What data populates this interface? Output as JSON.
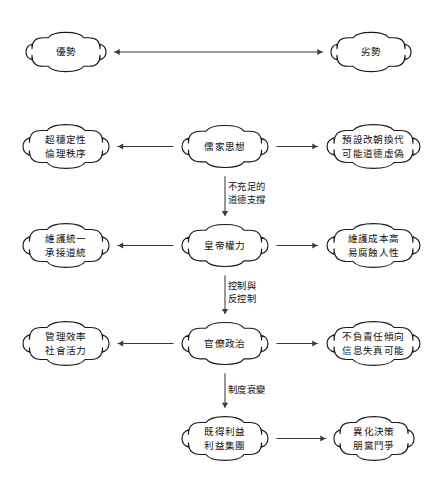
{
  "diagram": {
    "type": "flowchart",
    "background_color": "#ffffff",
    "node_fill": "#ffffff",
    "node_stroke": "#1a1a1a",
    "edge_color": "#3b3b3b",
    "nodes": [
      {
        "id": "advantage-header",
        "name": "advantage-header-node",
        "lines": [
          "優勢"
        ],
        "x": 25,
        "y": 31,
        "w": 82,
        "h": 42,
        "column": "left",
        "row": 0
      },
      {
        "id": "disadvantage-header",
        "name": "disadvantage-header-node",
        "lines": [
          "劣勢"
        ],
        "x": 330,
        "y": 31,
        "w": 82,
        "h": 42,
        "column": "right",
        "row": 0
      },
      {
        "id": "confucian-advantage",
        "name": "confucian-advantage-node",
        "lines": [
          "超穩定性",
          "倫理秩序"
        ],
        "x": 22,
        "y": 123,
        "w": 88,
        "h": 47,
        "column": "left",
        "row": 1
      },
      {
        "id": "confucian-thought",
        "name": "confucian-thought-node",
        "lines": [
          "儒家思想"
        ],
        "x": 181,
        "y": 124,
        "w": 88,
        "h": 45,
        "column": "center",
        "row": 1
      },
      {
        "id": "confucian-disadvantage",
        "name": "confucian-disadvantage-node",
        "lines": [
          "預設改朝換代",
          "可能道德虛偽"
        ],
        "x": 326,
        "y": 123,
        "w": 95,
        "h": 47,
        "column": "right",
        "row": 1
      },
      {
        "id": "emperor-advantage",
        "name": "emperor-advantage-node",
        "lines": [
          "維護統一",
          "承接道統"
        ],
        "x": 22,
        "y": 222,
        "w": 88,
        "h": 47,
        "column": "left",
        "row": 2
      },
      {
        "id": "emperor-power",
        "name": "emperor-power-node",
        "lines": [
          "皇帝權力"
        ],
        "x": 181,
        "y": 223,
        "w": 88,
        "h": 45,
        "column": "center",
        "row": 2
      },
      {
        "id": "emperor-disadvantage",
        "name": "emperor-disadvantage-node",
        "lines": [
          "維護成本高",
          "易腐蝕人性"
        ],
        "x": 326,
        "y": 222,
        "w": 95,
        "h": 47,
        "column": "right",
        "row": 2
      },
      {
        "id": "bureaucracy-advantage",
        "name": "bureaucracy-advantage-node",
        "lines": [
          "管理效率",
          "社會活力"
        ],
        "x": 22,
        "y": 320,
        "w": 88,
        "h": 47,
        "column": "left",
        "row": 3
      },
      {
        "id": "bureaucratic-politics",
        "name": "bureaucratic-politics-node",
        "lines": [
          "官僚政治"
        ],
        "x": 181,
        "y": 321,
        "w": 88,
        "h": 45,
        "column": "center",
        "row": 3
      },
      {
        "id": "bureaucracy-disadvantage",
        "name": "bureaucracy-disadvantage-node",
        "lines": [
          "不負責任傾向",
          "信息失真可能"
        ],
        "x": 326,
        "y": 320,
        "w": 95,
        "h": 47,
        "column": "right",
        "row": 3
      },
      {
        "id": "vested-interests",
        "name": "vested-interests-node",
        "lines": [
          "既得利益",
          "利益集團"
        ],
        "x": 181,
        "y": 415,
        "w": 88,
        "h": 47,
        "column": "center",
        "row": 4
      },
      {
        "id": "alienated-decision",
        "name": "alienated-decision-node",
        "lines": [
          "異化決策",
          "朋黨鬥爭"
        ],
        "x": 333,
        "y": 415,
        "w": 82,
        "h": 47,
        "column": "right",
        "row": 4
      }
    ],
    "edges": [
      {
        "id": "edge-header",
        "name": "edge-advantage-disadvantage",
        "from": "advantage-header",
        "to": "disadvantage-header",
        "direction": "both",
        "orientation": "horizontal",
        "label_lines": []
      },
      {
        "id": "edge-confucian-left",
        "name": "edge-confucian-to-advantage",
        "from": "confucian-thought",
        "to": "confucian-advantage",
        "direction": "left",
        "orientation": "horizontal",
        "label_lines": []
      },
      {
        "id": "edge-confucian-right",
        "name": "edge-confucian-to-disadvantage",
        "from": "confucian-thought",
        "to": "confucian-disadvantage",
        "direction": "right",
        "orientation": "horizontal",
        "label_lines": []
      },
      {
        "id": "edge-confucian-emperor",
        "name": "edge-confucian-to-emperor",
        "from": "confucian-thought",
        "to": "emperor-power",
        "direction": "down",
        "orientation": "vertical",
        "label_lines": [
          "不充足的",
          "道德支撐"
        ],
        "label_x": 228,
        "label_y": 180
      },
      {
        "id": "edge-emperor-left",
        "name": "edge-emperor-to-advantage",
        "from": "emperor-power",
        "to": "emperor-advantage",
        "direction": "left",
        "orientation": "horizontal",
        "label_lines": []
      },
      {
        "id": "edge-emperor-right",
        "name": "edge-emperor-to-disadvantage",
        "from": "emperor-power",
        "to": "emperor-disadvantage",
        "direction": "right",
        "orientation": "horizontal",
        "label_lines": []
      },
      {
        "id": "edge-emperor-bureaucracy",
        "name": "edge-emperor-to-bureaucracy",
        "from": "emperor-power",
        "to": "bureaucratic-politics",
        "direction": "down",
        "orientation": "vertical",
        "label_lines": [
          "控制與",
          "反控制"
        ],
        "label_x": 228,
        "label_y": 279
      },
      {
        "id": "edge-bureaucracy-left",
        "name": "edge-bureaucracy-to-advantage",
        "from": "bureaucratic-politics",
        "to": "bureaucracy-advantage",
        "direction": "left",
        "orientation": "horizontal",
        "label_lines": []
      },
      {
        "id": "edge-bureaucracy-right",
        "name": "edge-bureaucracy-to-disadvantage",
        "from": "bureaucratic-politics",
        "to": "bureaucracy-disadvantage",
        "direction": "right",
        "orientation": "horizontal",
        "label_lines": []
      },
      {
        "id": "edge-bureaucracy-vested",
        "name": "edge-bureaucracy-to-vested-interests",
        "from": "bureaucratic-politics",
        "to": "vested-interests",
        "direction": "down",
        "orientation": "vertical",
        "label_lines": [
          "制度衰變"
        ],
        "label_x": 228,
        "label_y": 383
      },
      {
        "id": "edge-vested-alienated",
        "name": "edge-vested-to-alienated",
        "from": "vested-interests",
        "to": "alienated-decision",
        "direction": "right",
        "orientation": "horizontal",
        "label_lines": []
      }
    ]
  }
}
